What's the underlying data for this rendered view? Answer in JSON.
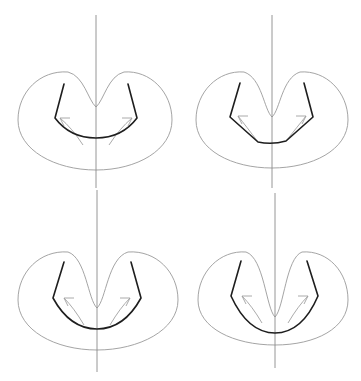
{
  "figure": {
    "colors": {
      "background": "#ffffff",
      "axis": "#8a8a8a",
      "outline": "#9a9a9a",
      "contour": "#1e1e1e",
      "arrow": "#a0a0a0"
    },
    "panels": [
      {
        "id": "panel-1",
        "position": "top-left",
        "axis": {
          "x": 96,
          "y1": 15,
          "y2": 188
        },
        "outline": "M96,107 C88,100 84,76 68,72 C40,70 18,92 18,120 C18,150 55,170 96,170 C137,170 172,150 172,120 C172,92 150,70 124,72 C108,76 104,100 96,107 Z",
        "contour": "M64,84 L55,118 Q70,138 96,138 Q122,138 137,118 L128,84",
        "arrows": [
          "M83,145 Q72,128 60,118 M60,118 L70,118 M60,118 L64,126",
          "M109,145 Q120,128 132,118 M132,118 L122,118 M132,118 L128,126"
        ]
      },
      {
        "id": "panel-2",
        "position": "top-right",
        "axis": {
          "x": 272,
          "y1": 15,
          "y2": 188
        },
        "outline": "M272,117 C264,110 262,78 244,72 C218,70 196,92 196,120 C196,150 232,168 272,168 C312,168 348,150 348,120 C348,92 326,70 300,72 C282,78 280,110 272,117 Z",
        "contour": "M240,83 L230,117 L258,142 Q272,145 286,141 L313,117 L304,83",
        "arrows": [
          "M258,142 Q246,126 238,116 M238,116 L248,116 M238,116 L242,124",
          "M286,141 Q298,126 306,116 M306,116 L296,116 M306,116 L302,124"
        ]
      },
      {
        "id": "panel-3",
        "position": "bottom-left",
        "axis": {
          "x": 97,
          "y1": 190,
          "y2": 372
        },
        "outline": "M97,308 C88,300 86,258 68,252 C40,250 18,272 18,300 C18,330 55,350 97,350 C139,350 178,330 178,300 C178,272 156,250 128,252 C108,258 106,300 97,308 Z",
        "contour": "M64,262 L53,298 Q70,329 97,329 Q124,329 141,298 L131,262",
        "arrows": [
          "M84,325 Q74,308 64,298 M64,298 L74,298 M64,298 L68,306",
          "M110,325 Q120,308 130,298 M130,298 L120,298 M130,298 L126,306"
        ]
      },
      {
        "id": "panel-4",
        "position": "bottom-right",
        "axis": {
          "x": 275,
          "y1": 193,
          "y2": 368
        },
        "outline": "M275,317 C266,308 264,258 246,252 C220,250 198,272 198,300 C198,328 234,345 275,345 C316,345 348,328 348,300 C348,272 328,250 302,252 C286,258 284,308 275,317 Z",
        "contour": "M241,261 L231,296 Q248,333 275,333 Q302,333 318,296 L307,261",
        "arrows": [
          "M262,323 Q252,306 242,296 M242,296 L252,296 M242,296 L246,304",
          "M288,323 Q298,306 308,296 M308,296 L298,296 M308,296 L304,304"
        ]
      }
    ]
  }
}
